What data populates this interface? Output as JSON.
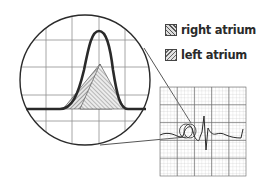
{
  "legend": {
    "items": [
      {
        "label": "right atrium",
        "pattern": "dense-hatch"
      },
      {
        "label": "left atrium",
        "pattern": "light-hatch"
      }
    ]
  },
  "diagram": {
    "magnifier_shape": "circle",
    "strip_shape": "grid-square",
    "colors": {
      "line": "#2a2a2a",
      "grid": "#9a9a9a",
      "hatch": "#555555"
    }
  }
}
